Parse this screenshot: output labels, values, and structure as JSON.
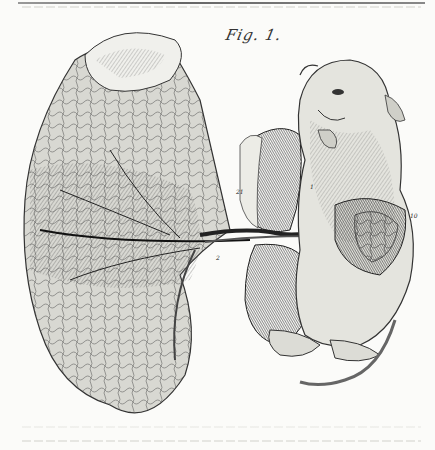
{
  "figure": {
    "title": "Fig. 1.",
    "labels": [
      "21",
      "1",
      "10",
      "2"
    ],
    "ink_color": "#2a2a2a",
    "paper_color": "#fbfbf9"
  }
}
